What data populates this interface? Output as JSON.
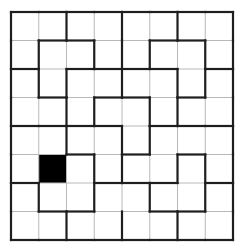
{
  "puzzle": {
    "rows": 8,
    "cols": 8,
    "origin": {
      "x": 11,
      "y": 12
    },
    "cell": {
      "w": 27.75,
      "h": 28.5
    },
    "colors": {
      "thin_line": "#b8b8b8",
      "thick_line": "#1e1e1e",
      "fill": "#000000",
      "background": "#ffffff"
    },
    "filled_cells": [
      [
        5,
        1
      ]
    ],
    "thick_vertical": [
      [
        0,
        2,
        4,
        6,
        8
      ],
      [
        0,
        1,
        3,
        4,
        5,
        7,
        8
      ],
      [
        0,
        1,
        2,
        4,
        6,
        7,
        8
      ],
      [
        0,
        2,
        3,
        5,
        6,
        8
      ],
      [
        0,
        2,
        4,
        5,
        8
      ],
      [
        0,
        3,
        4,
        6,
        7,
        8
      ],
      [
        0,
        1,
        3,
        5,
        7,
        8
      ],
      [
        0,
        2,
        4,
        6,
        8
      ]
    ],
    "thick_horizontal": [
      [
        0,
        1,
        2,
        3,
        4,
        5,
        6,
        7
      ],
      [
        1,
        2,
        5,
        6
      ],
      [
        0,
        2,
        3,
        4,
        5,
        7
      ],
      [
        1,
        3,
        4,
        6
      ],
      [
        0,
        1,
        2,
        3,
        5,
        6,
        7
      ],
      [
        2,
        4,
        6
      ],
      [
        0,
        3,
        4,
        5,
        7
      ],
      [
        1,
        2,
        5,
        6
      ],
      [
        0,
        1,
        2,
        3,
        4,
        5,
        6,
        7
      ]
    ]
  }
}
